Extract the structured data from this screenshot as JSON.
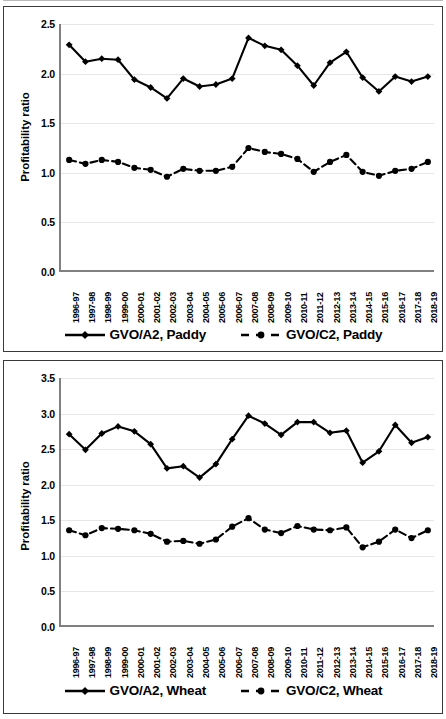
{
  "chart_data": [
    {
      "type": "line",
      "title": "",
      "panel_name": "paddy",
      "xlabel": "",
      "ylabel": "Profitability ratio",
      "ylim": [
        0.0,
        2.5
      ],
      "yticks": [
        "0.0",
        "0.5",
        "1.0",
        "1.5",
        "2.0",
        "2.5"
      ],
      "grid": true,
      "legend_position": "bottom",
      "categories": [
        "1996-97",
        "1997-98",
        "1998-99",
        "1999-00",
        "2000-01",
        "2001-02",
        "2002-03",
        "2003-04",
        "2004-05",
        "2005-06",
        "2006-07",
        "2007-08",
        "2008-09",
        "2009-10",
        "2010-11",
        "2011-12",
        "2012-13",
        "2013-14",
        "2014-15",
        "2015-16",
        "2016-17",
        "2017-18",
        "2018-19"
      ],
      "series": [
        {
          "name": "GVO/A2, Paddy",
          "style": "solid",
          "marker": "diamond",
          "values": [
            2.29,
            2.12,
            2.15,
            2.14,
            1.94,
            1.86,
            1.75,
            1.95,
            1.87,
            1.89,
            1.95,
            2.36,
            2.28,
            2.24,
            2.08,
            1.88,
            2.11,
            2.22,
            1.96,
            1.82,
            1.97,
            1.92,
            1.97
          ]
        },
        {
          "name": "GVO/C2, Paddy",
          "style": "dashed",
          "marker": "circle",
          "values": [
            1.13,
            1.09,
            1.13,
            1.11,
            1.05,
            1.03,
            0.96,
            1.04,
            1.02,
            1.02,
            1.06,
            1.25,
            1.21,
            1.19,
            1.14,
            1.01,
            1.11,
            1.18,
            1.01,
            0.97,
            1.02,
            1.04,
            1.11
          ]
        }
      ]
    },
    {
      "type": "line",
      "title": "",
      "panel_name": "wheat",
      "xlabel": "",
      "ylabel": "Profitability ratio",
      "ylim": [
        0.0,
        3.5
      ],
      "yticks": [
        "0.0",
        "0.5",
        "1.0",
        "1.5",
        "2.0",
        "2.5",
        "3.0",
        "3.5"
      ],
      "grid": true,
      "legend_position": "bottom",
      "categories": [
        "1996-97",
        "1997-98",
        "1998-99",
        "1999-00",
        "2000-01",
        "2001-02",
        "2002-03",
        "2003-04",
        "2004-05",
        "2005-06",
        "2006-07",
        "2007-08",
        "2008-09",
        "2009-10",
        "2010-11",
        "2011-12",
        "2012-13",
        "2013-14",
        "2014-15",
        "2015-16",
        "2016-17",
        "2017-18",
        "2018-19"
      ],
      "series": [
        {
          "name": "GVO/A2, Wheat",
          "style": "solid",
          "marker": "diamond",
          "values": [
            2.71,
            2.49,
            2.72,
            2.82,
            2.75,
            2.57,
            2.23,
            2.26,
            2.1,
            2.29,
            2.64,
            2.97,
            2.86,
            2.7,
            2.88,
            2.88,
            2.73,
            2.76,
            2.31,
            2.47,
            2.84,
            2.59,
            2.67
          ]
        },
        {
          "name": "GVO/C2, Wheat",
          "style": "dashed",
          "marker": "circle",
          "values": [
            1.36,
            1.29,
            1.39,
            1.38,
            1.36,
            1.31,
            1.2,
            1.21,
            1.17,
            1.23,
            1.41,
            1.53,
            1.37,
            1.32,
            1.42,
            1.37,
            1.36,
            1.4,
            1.12,
            1.2,
            1.37,
            1.25,
            1.36
          ]
        }
      ]
    }
  ],
  "colors": {
    "series_line": "#000000",
    "axis": "#808080",
    "grid": "#e6e6e6",
    "panel_border": "#3a3a3a",
    "background": "#ffffff"
  }
}
